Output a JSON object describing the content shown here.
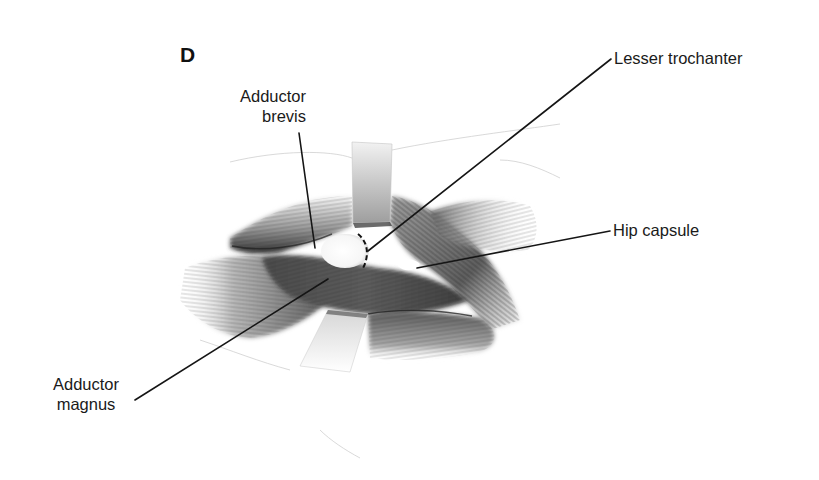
{
  "figure": {
    "panel_letter": "D",
    "style": {
      "ink_color": "#1a1a1a",
      "shading_dark": "#3a3a3a",
      "shading_mid": "#8a8a8a",
      "shading_light": "#d0d0d0",
      "bone_color": "#ffffff",
      "background": "#ffffff"
    }
  },
  "labels": {
    "adductor_brevis": {
      "line1": "Adductor",
      "line2": "brevis"
    },
    "lesser_trochanter": {
      "text": "Lesser trochanter"
    },
    "hip_capsule": {
      "text": "Hip capsule"
    },
    "adductor_magnus": {
      "line1": "Adductor",
      "line2": "magnus"
    }
  },
  "leader_lines": [
    {
      "name": "adductor-brevis-leader",
      "from": [
        299,
        133
      ],
      "to": [
        315,
        248
      ]
    },
    {
      "name": "lesser-trochanter-leader",
      "from": [
        611,
        59
      ],
      "to": [
        368,
        251
      ]
    },
    {
      "name": "hip-capsule-leader",
      "from": [
        610,
        231
      ],
      "to": [
        417,
        268
      ]
    },
    {
      "name": "adductor-magnus-leader",
      "from": [
        135,
        400
      ],
      "to": [
        328,
        279
      ]
    }
  ],
  "structures": [
    {
      "name": "upper-retractor",
      "description": "retractor blade holding adductor brevis"
    },
    {
      "name": "lower-retractor",
      "description": "retractor blade holding adductor magnus"
    },
    {
      "name": "lesser-trochanter-bone",
      "description": "exposed bony prominence with dashed osteotomy line"
    },
    {
      "name": "hip-capsule-window",
      "description": "small white window of exposed capsule"
    }
  ]
}
